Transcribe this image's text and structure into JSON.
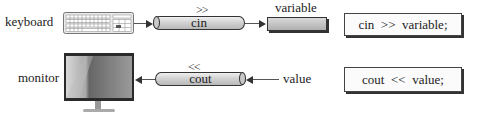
{
  "input_row": {
    "device_label": "keyboard",
    "device_icon": "keyboard-icon",
    "operator": ">>",
    "stream_label": "cin",
    "target_label": "variable",
    "code": "cin  >>  variable;"
  },
  "output_row": {
    "device_label": "monitor",
    "device_icon": "monitor-icon",
    "operator": "<<",
    "stream_label": "cout",
    "source_label": "value",
    "code": "cout  <<  value;"
  },
  "colors": {
    "stroke": "#333333",
    "pipe_fill": "#c9c9c9",
    "background": "#ffffff"
  }
}
